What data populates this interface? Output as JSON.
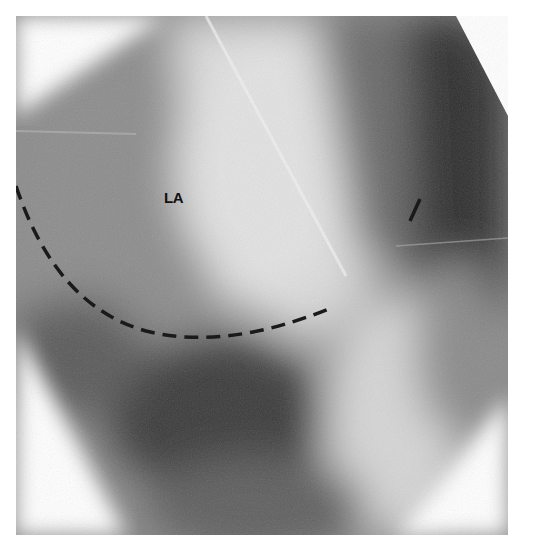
{
  "figure": {
    "type": "fluoroscopic radiograph",
    "labels": [
      {
        "text": "LA",
        "x": 164,
        "y": 180
      }
    ],
    "annotation": {
      "kind": "dashed-arc",
      "color": "#1a1a1a",
      "description": "dashed outline of left atrium border"
    },
    "colors": {
      "background": "#ffffff",
      "dark_region": "#2a2a2a",
      "light_region": "#e8e8e8"
    }
  }
}
